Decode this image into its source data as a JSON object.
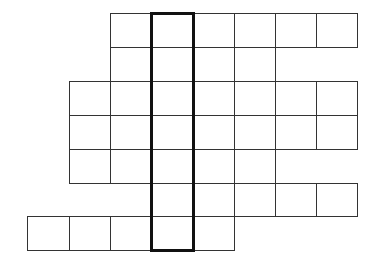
{
  "diagram": {
    "type": "grid-figure",
    "origin_x": 27,
    "origin_y": 13,
    "col_edges": [
      27,
      69,
      110,
      151,
      193,
      234,
      275,
      316,
      357
    ],
    "row_edges": [
      13,
      47,
      81,
      115,
      149,
      183,
      216,
      250
    ],
    "line_color": "#333333",
    "highlight_color": "#111111",
    "rows": [
      {
        "row": 0,
        "start_col": 2,
        "end_col": 7
      },
      {
        "row": 1,
        "start_col": 2,
        "end_col": 5
      },
      {
        "row": 2,
        "start_col": 1,
        "end_col": 7
      },
      {
        "row": 3,
        "start_col": 1,
        "end_col": 7
      },
      {
        "row": 4,
        "start_col": 1,
        "end_col": 5
      },
      {
        "row": 5,
        "start_col": 3,
        "end_col": 7
      },
      {
        "row": 6,
        "start_col": 0,
        "end_col": 4
      }
    ],
    "highlight": {
      "col": 3,
      "row_start": 0,
      "row_end": 6
    }
  }
}
